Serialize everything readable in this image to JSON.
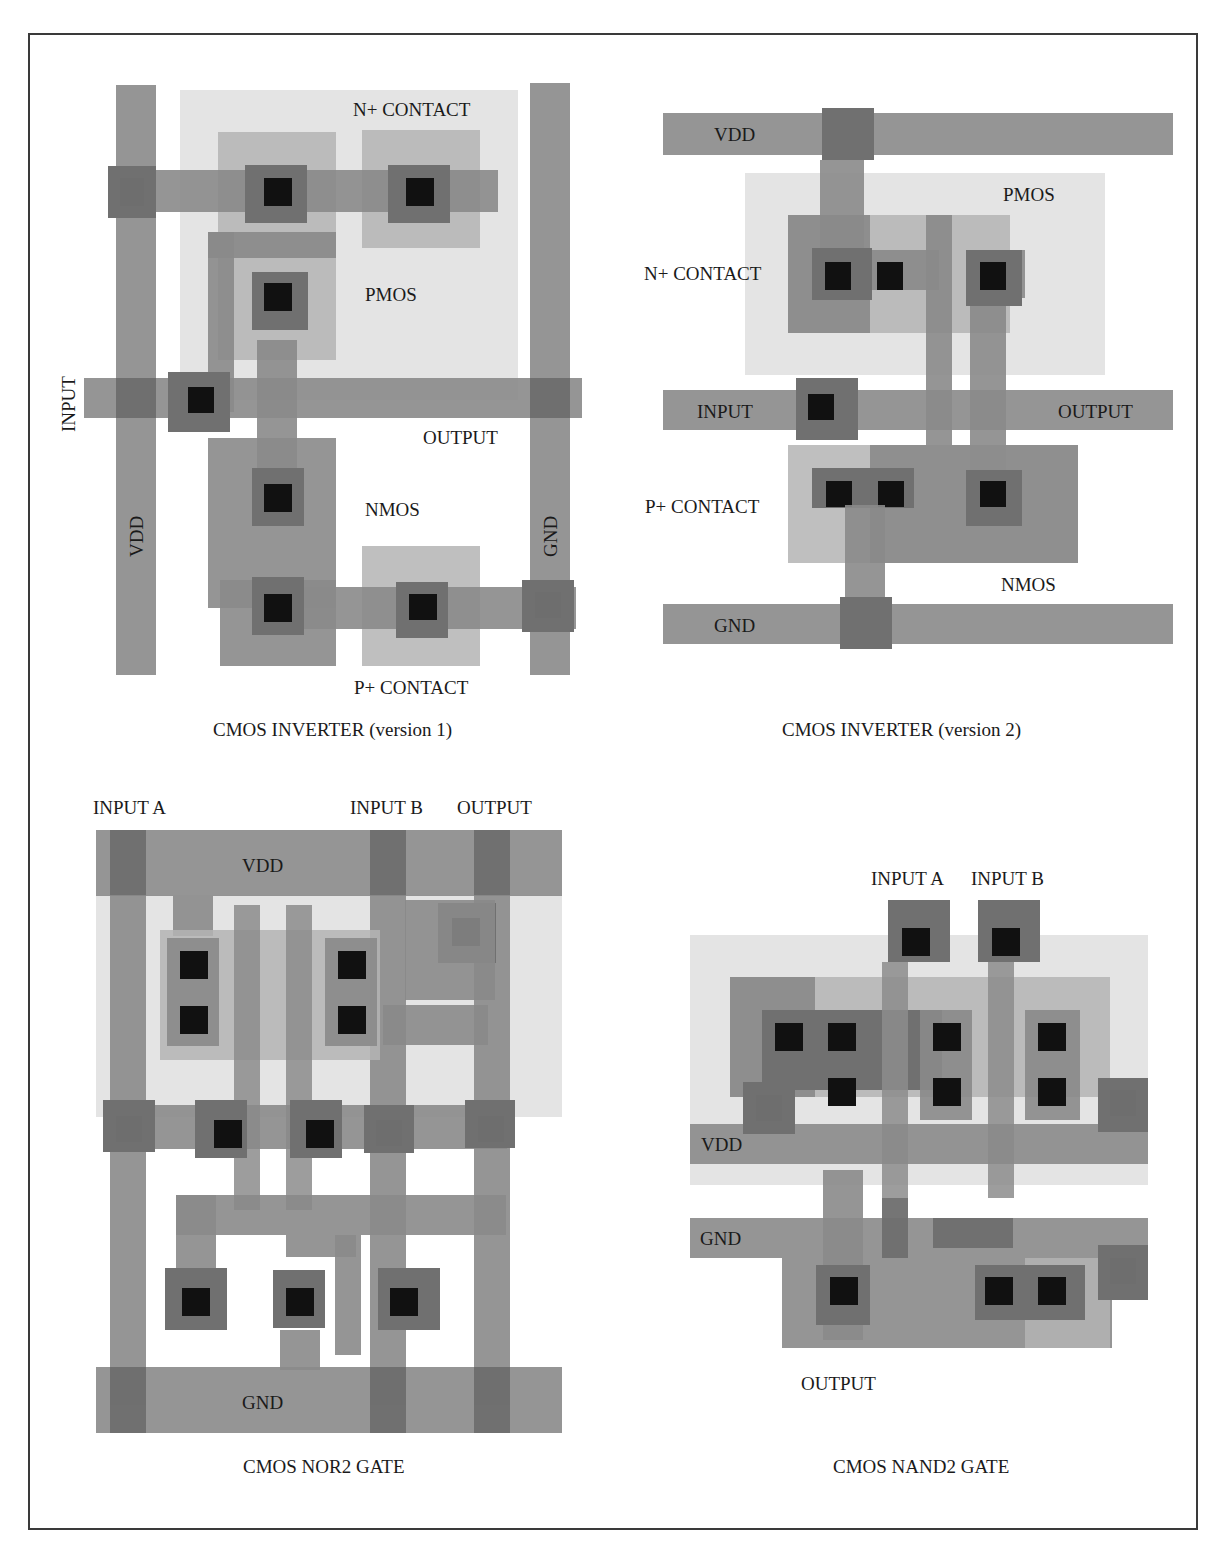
{
  "figure": {
    "colors": {
      "background": "#ffffff",
      "frame": "#3a3a3a",
      "well": "#e4e4e4",
      "diffusion": "#b4b4b4",
      "poly": "#8c8c8c",
      "metal": "#8a8a8a",
      "metal_overlap": "#6e6e6e",
      "contact_pad": "#707070",
      "contact": "#111111",
      "text": "#1a1a1a"
    },
    "panels": [
      {
        "id": "inverter-v1",
        "caption": "CMOS INVERTER (version 1)",
        "labels": {
          "n_contact": "N+ CONTACT",
          "pmos": "PMOS",
          "input": "INPUT",
          "output": "OUTPUT",
          "nmos": "NMOS",
          "vdd": "VDD",
          "gnd": "GND",
          "p_contact": "P+ CONTACT"
        }
      },
      {
        "id": "inverter-v2",
        "caption": "CMOS INVERTER (version 2)",
        "labels": {
          "vdd": "VDD",
          "pmos": "PMOS",
          "n_contact": "N+ CONTACT",
          "input": "INPUT",
          "output": "OUTPUT",
          "p_contact": "P+ CONTACT",
          "nmos": "NMOS",
          "gnd": "GND"
        }
      },
      {
        "id": "nor2",
        "caption": "CMOS NOR2 GATE",
        "labels": {
          "input_a": "INPUT A",
          "input_b": "INPUT B",
          "output": "OUTPUT",
          "vdd": "VDD",
          "gnd": "GND"
        }
      },
      {
        "id": "nand2",
        "caption": "CMOS NAND2 GATE",
        "labels": {
          "input_a": "INPUT A",
          "input_b": "INPUT B",
          "vdd": "VDD",
          "gnd": "GND",
          "output": "OUTPUT"
        }
      }
    ]
  }
}
